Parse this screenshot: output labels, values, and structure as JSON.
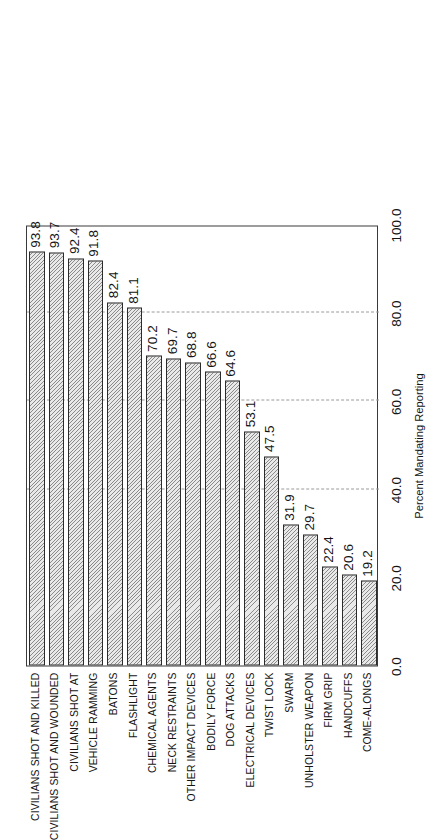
{
  "chart_data": {
    "type": "bar",
    "orientation": "horizontal",
    "title": "",
    "subtitle": "",
    "xlabel": "Percent Mandating Reporting",
    "ylabel": "",
    "xlim": [
      0.0,
      100.0
    ],
    "xticks": [
      "0.0",
      "20.0",
      "40.0",
      "60.0",
      "80.0",
      "100.0"
    ],
    "xtick_values": [
      0,
      20,
      40,
      60,
      80,
      100
    ],
    "grid": true,
    "gridlines_at": [
      40,
      60,
      80
    ],
    "legend": null,
    "categories": [
      "CIVILIANS SHOT AND KILLED",
      "CIVILIANS SHOT AND WOUNDED",
      "CIVILIANS SHOT AT",
      "VEHICLE RAMMING",
      "BATONS",
      "FLASHLIGHT",
      "CHEMICAL AGENTS",
      "NECK RESTRAINTS",
      "OTHER IMPACT DEVICES",
      "BODILY FORCE",
      "DOG ATTACKS",
      "ELECTRICAL DEVICES",
      "TWIST LOCK",
      "SWARM",
      "UNHOLSTER WEAPON",
      "FIRM GRIP",
      "HANDCUFFS",
      "COME-ALONGS"
    ],
    "values": [
      93.8,
      93.7,
      92.4,
      91.8,
      82.4,
      81.1,
      70.2,
      69.7,
      68.8,
      66.6,
      64.6,
      53.1,
      47.5,
      31.9,
      29.7,
      22.4,
      20.6,
      19.2
    ],
    "value_labels": [
      "93.8",
      "93.7",
      "92.4",
      "91.8",
      "82.4",
      "81.1",
      "70.2",
      "69.7",
      "68.8",
      "66.6",
      "64.6",
      "53.1",
      "47.5",
      "31.9",
      "29.7",
      "22.4",
      "20.6",
      "19.2"
    ],
    "colors": {
      "bar_fill": "#e9e9e9",
      "bar_hatch": "#3c3c3c",
      "bar_edge": "#2b2b2b",
      "frame": "#3a3a3a",
      "gridline": "#9a9a9a",
      "text": "#141414",
      "background": "#ffffff"
    }
  }
}
